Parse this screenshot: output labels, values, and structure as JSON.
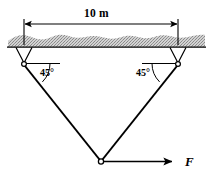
{
  "figure": {
    "title_label": "10 m",
    "dimension": {
      "value": "10 m",
      "left_x": 24,
      "right_x": 178,
      "y": 24
    },
    "ground": {
      "fill_color": "#c9c9c9",
      "line_color": "#000000",
      "left_x": 8,
      "right_x": 205,
      "top_y": 33,
      "bottom_y": 47
    },
    "supports": [
      {
        "name": "left-pin-support",
        "angle_label": "45°",
        "pin_x": 24,
        "pin_y": 64,
        "label_x": 40,
        "label_y": 68
      },
      {
        "name": "right-pin-support",
        "angle_label": "45°",
        "pin_x": 178,
        "pin_y": 64,
        "label_x": 136,
        "label_y": 68
      }
    ],
    "apex": {
      "name": "apex-joint",
      "x": 101,
      "y": 161
    },
    "force": {
      "label": "F",
      "start_x": 101,
      "end_x": 172,
      "y": 161,
      "label_x": 185,
      "label_y": 155
    },
    "stroke_color": "#000000"
  }
}
